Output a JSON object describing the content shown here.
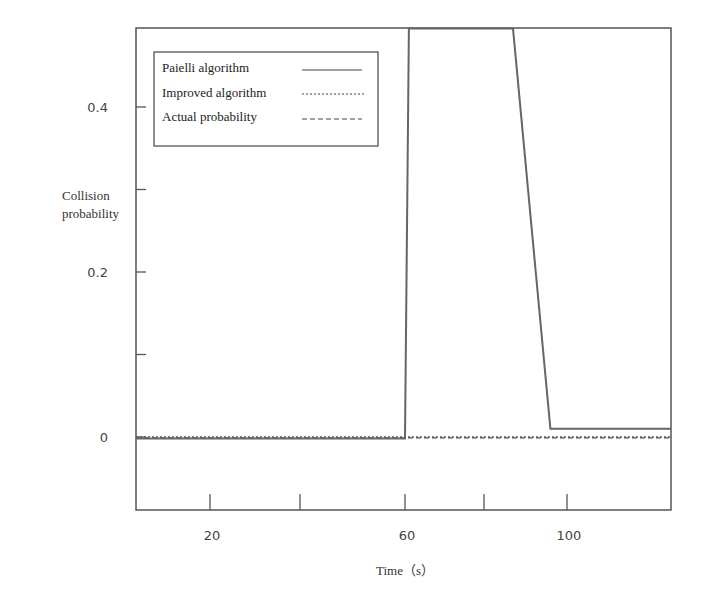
{
  "chart_data": {
    "type": "line",
    "title": "",
    "xlabel": "Time（s）",
    "ylabel": "Collision probability",
    "ylabel_lines": [
      "Collision",
      "probability"
    ],
    "xlim": [
      4,
      121
    ],
    "ylim": [
      -0.085,
      0.495
    ],
    "x_ticks": [
      {
        "value": 20,
        "label": "20",
        "px": 210
      },
      {
        "value": 40,
        "label": "",
        "px": 300
      },
      {
        "value": 60,
        "label": "60",
        "px": 405
      },
      {
        "value": 80,
        "label": "",
        "px": 484
      },
      {
        "value": 100,
        "label": "100",
        "px": 567
      }
    ],
    "y_ticks": [
      {
        "value": 0,
        "label": "0"
      },
      {
        "value": 0.1,
        "label": ""
      },
      {
        "value": 0.2,
        "label": "0.2"
      },
      {
        "value": 0.3,
        "label": ""
      },
      {
        "value": 0.4,
        "label": "0.4"
      }
    ],
    "grid": false,
    "legend_position": "upper left",
    "series": [
      {
        "name": "Paielli algorithm",
        "style": "solid",
        "color": "#666666",
        "points": [
          [
            4,
            -0.002
          ],
          [
            60,
            -0.002
          ],
          [
            61,
            0.495
          ],
          [
            87,
            0.495
          ],
          [
            96,
            0.01
          ],
          [
            121,
            0.01
          ]
        ]
      },
      {
        "name": "Improved algorithm",
        "style": "dotted",
        "color": "#555555",
        "points": [
          [
            4,
            0.0
          ],
          [
            121,
            0.0
          ]
        ]
      },
      {
        "name": "Actual probability",
        "style": "dashed",
        "color": "#555555",
        "points": [
          [
            4,
            -0.001
          ],
          [
            121,
            -0.001
          ]
        ]
      }
    ]
  },
  "legend": {
    "items": [
      {
        "label": "Paielli algorithm"
      },
      {
        "label": "Improved algorithm"
      },
      {
        "label": "Actual probability"
      }
    ]
  }
}
